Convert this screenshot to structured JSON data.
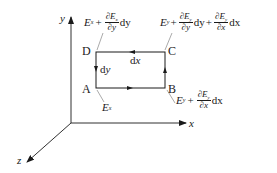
{
  "figure": {
    "axes": {
      "x_label": "x",
      "y_label": "y",
      "z_label": "z"
    },
    "rectangle": {
      "corners": {
        "A": "A",
        "B": "B",
        "C": "C",
        "D": "D"
      },
      "side_labels": {
        "dx": "dx",
        "dy": "dy"
      }
    },
    "field_labels": {
      "AB": {
        "E": "E",
        "sub": "x"
      },
      "BC": {
        "E": "E",
        "sub": "y",
        "plus": "+",
        "num_d": "∂E",
        "num_sub": "y",
        "den": "∂x",
        "tail": "dx"
      },
      "DC": {
        "E": "E",
        "sub": "x",
        "plus": "+",
        "num_d": "∂E",
        "num_sub": "x",
        "den": "∂y",
        "tail": "dy"
      },
      "CD_right": {
        "E": "E",
        "sub": "y",
        "plus1": "+",
        "num1_d": "∂E",
        "num1_sub": "y",
        "den1": "∂y",
        "tail1": "dy",
        "plus2": "+",
        "num2_d": "∂E",
        "num2_sub": "y",
        "den2": "∂x",
        "tail2": "dx"
      }
    },
    "colors": {
      "ink": "#1a1a1a",
      "background": "#ffffff"
    }
  }
}
